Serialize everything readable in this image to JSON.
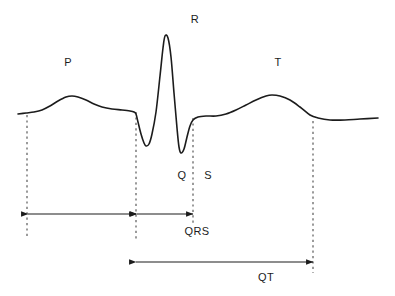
{
  "figure": {
    "background_color": "#ffffff",
    "trace_color": "#1c1c1c",
    "guide_color": "#4a4a4a",
    "label_color": "#1c1c1c",
    "width": 395,
    "height": 296
  },
  "wave_labels": [
    {
      "id": "p-wave-label",
      "text": "P",
      "x": 68,
      "y": 62
    },
    {
      "id": "r-wave-label",
      "text": "R",
      "x": 195,
      "y": 19
    },
    {
      "id": "q-wave-label",
      "text": "Q",
      "x": 182,
      "y": 175
    },
    {
      "id": "s-wave-label",
      "text": "S",
      "x": 208,
      "y": 175
    },
    {
      "id": "t-wave-label",
      "text": "T",
      "x": 278,
      "y": 62
    }
  ],
  "interval_labels": [
    {
      "id": "qrs-interval-label",
      "text": "QRS",
      "x": 197,
      "y": 231
    },
    {
      "id": "qt-interval-label",
      "text": "QT",
      "x": 266,
      "y": 277
    }
  ],
  "guide_lines": [
    {
      "id": "guide-p-onset",
      "x": 27,
      "y1": 115,
      "y2": 239
    },
    {
      "id": "guide-qrs-onset",
      "x": 136,
      "y1": 112,
      "y2": 239
    },
    {
      "id": "guide-qrs-end",
      "x": 193,
      "y1": 118,
      "y2": 226
    },
    {
      "id": "guide-t-end",
      "x": 313,
      "y1": 121,
      "y2": 273
    }
  ],
  "measurement_arrows": [
    {
      "id": "pr-interval-arrow",
      "x1": 28,
      "x2": 136,
      "y": 214,
      "heads": "both"
    },
    {
      "id": "qrs-width-arrow",
      "x1": 137,
      "x2": 193,
      "y": 214,
      "heads": "both"
    },
    {
      "id": "qt-interval-arrow",
      "x1": 136,
      "x2": 313,
      "y": 262,
      "heads": "both"
    }
  ],
  "chart_data": {
    "type": "line",
    "xlabel": "",
    "ylabel": "",
    "xlim": [
      0,
      395
    ],
    "ylim": [
      296,
      0
    ],
    "grid": false,
    "legend": null,
    "baseline_y": 114,
    "annotations": [
      "P",
      "R",
      "Q",
      "S",
      "T",
      "QRS",
      "QT"
    ],
    "series": [
      {
        "name": "ecg-trace",
        "points": [
          [
            18,
            114
          ],
          [
            26,
            113
          ],
          [
            34,
            112
          ],
          [
            42,
            110
          ],
          [
            50,
            106
          ],
          [
            58,
            101
          ],
          [
            66,
            97
          ],
          [
            72,
            96
          ],
          [
            78,
            97
          ],
          [
            86,
            100
          ],
          [
            94,
            104
          ],
          [
            102,
            107
          ],
          [
            112,
            109
          ],
          [
            122,
            110
          ],
          [
            130,
            111
          ],
          [
            134,
            112
          ],
          [
            136,
            114
          ],
          [
            138,
            122
          ],
          [
            141,
            134
          ],
          [
            144,
            143
          ],
          [
            146,
            146
          ],
          [
            149,
            144
          ],
          [
            152,
            134
          ],
          [
            156,
            112
          ],
          [
            160,
            76
          ],
          [
            163,
            48
          ],
          [
            165,
            36
          ],
          [
            168,
            38
          ],
          [
            171,
            57
          ],
          [
            174,
            93
          ],
          [
            177,
            128
          ],
          [
            179,
            147
          ],
          [
            181,
            153
          ],
          [
            184,
            149
          ],
          [
            187,
            137
          ],
          [
            190,
            126
          ],
          [
            193,
            120
          ],
          [
            198,
            117
          ],
          [
            206,
            116
          ],
          [
            216,
            116
          ],
          [
            226,
            114
          ],
          [
            236,
            110
          ],
          [
            246,
            105
          ],
          [
            256,
            100
          ],
          [
            266,
            96
          ],
          [
            272,
            95
          ],
          [
            280,
            96
          ],
          [
            290,
            100
          ],
          [
            300,
            107
          ],
          [
            310,
            115
          ],
          [
            318,
            118
          ],
          [
            330,
            120
          ],
          [
            345,
            120
          ],
          [
            360,
            119
          ],
          [
            378,
            118
          ]
        ]
      }
    ]
  }
}
